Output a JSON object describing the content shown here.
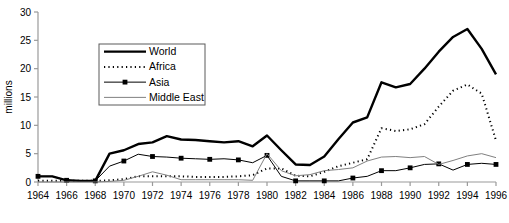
{
  "chart_data": {
    "type": "line",
    "title": "",
    "xlabel": "",
    "ylabel": "millions",
    "xlim": [
      1964,
      1996
    ],
    "ylim": [
      0,
      30
    ],
    "ytick_step": 5,
    "xtick_step": 2,
    "grid": false,
    "legend_position": "upper-left-inside",
    "yticks": [
      "0",
      "5",
      "10",
      "15",
      "20",
      "25",
      "30"
    ],
    "xticks": [
      "1964",
      "1966",
      "1968",
      "1970",
      "1972",
      "1974",
      "1976",
      "1978",
      "1980",
      "1982",
      "1984",
      "1986",
      "1988",
      "1990",
      "1992",
      "1994",
      "1996"
    ],
    "x": [
      1964,
      1965,
      1966,
      1967,
      1968,
      1969,
      1970,
      1971,
      1972,
      1973,
      1974,
      1975,
      1976,
      1977,
      1978,
      1979,
      1980,
      1981,
      1982,
      1983,
      1984,
      1985,
      1986,
      1987,
      1988,
      1989,
      1990,
      1991,
      1992,
      1993,
      1994,
      1995,
      1996
    ],
    "series": [
      {
        "name": "World",
        "style": "thick-solid",
        "color": "#000000",
        "values": [
          1.0,
          1.0,
          0.3,
          0.2,
          0.2,
          5.0,
          5.6,
          6.7,
          7.0,
          8.1,
          7.5,
          7.4,
          7.2,
          7.0,
          7.2,
          6.3,
          8.2,
          5.6,
          3.1,
          3.0,
          4.5,
          7.6,
          10.5,
          11.4,
          17.6,
          16.7,
          17.3,
          20.0,
          23.0,
          25.6,
          27.0,
          23.5,
          19.0
        ]
      },
      {
        "name": "Africa",
        "style": "dotted",
        "color": "#000000",
        "values": [
          0.2,
          0.2,
          0.2,
          0.2,
          0.2,
          0.3,
          0.5,
          1.0,
          1.0,
          1.0,
          1.0,
          0.9,
          0.9,
          0.9,
          1.0,
          1.2,
          2.4,
          2.4,
          1.1,
          1.0,
          1.8,
          2.8,
          3.4,
          4.0,
          9.5,
          9.0,
          9.3,
          10.2,
          13.3,
          16.1,
          17.2,
          15.6,
          7.3
        ]
      },
      {
        "name": "Asia",
        "style": "marker-line",
        "color": "#000000",
        "values": [
          1.0,
          1.0,
          0.3,
          0.2,
          0.2,
          2.8,
          3.7,
          4.9,
          4.5,
          4.4,
          4.2,
          4.1,
          4.0,
          4.1,
          3.9,
          3.4,
          4.7,
          1.0,
          0.2,
          0.2,
          0.2,
          0.2,
          0.7,
          1.0,
          2.0,
          2.0,
          2.5,
          3.1,
          3.2,
          2.1,
          3.1,
          3.3,
          3.1
        ]
      },
      {
        "name": "Middle East",
        "style": "thin-solid",
        "color": "#808080",
        "values": [
          0.0,
          0.0,
          0.0,
          0.0,
          0.0,
          0.1,
          0.3,
          1.0,
          1.8,
          1.2,
          0.4,
          0.4,
          0.4,
          0.4,
          0.4,
          0.3,
          5.0,
          2.0,
          1.1,
          1.3,
          2.0,
          2.2,
          2.5,
          3.7,
          4.4,
          4.5,
          4.3,
          4.5,
          3.1,
          3.8,
          4.6,
          5.0,
          4.3
        ]
      }
    ]
  }
}
